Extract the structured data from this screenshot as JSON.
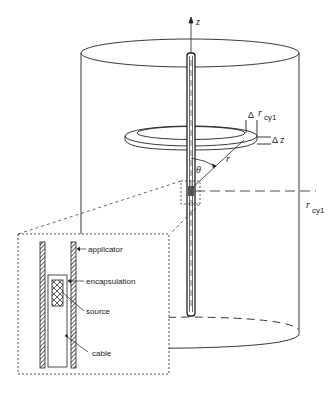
{
  "diagram": {
    "type": "brachytherapy source geometry in cylindrical phantom",
    "labels": {
      "z_axis": "z",
      "delta_r_sym": "Δ",
      "r_cyl_top": "r",
      "r_cyl_top_sub": "cyl",
      "delta_z": "Δ z",
      "theta": "θ",
      "r": "r",
      "r_cyl_right": "r",
      "r_cyl_right_sub": "cy1"
    },
    "inset": {
      "applicator": "applicator",
      "encapsulation": "encapsulation",
      "source": "source",
      "cable": "cable"
    },
    "colors": {
      "line": "#222222",
      "background": "#ffffff",
      "source_fill": "#555555"
    }
  }
}
